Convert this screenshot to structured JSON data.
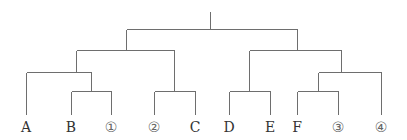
{
  "diagram": {
    "type": "tree",
    "leaves": [
      {
        "id": "A",
        "label": "A",
        "x": 26,
        "style": "letter"
      },
      {
        "id": "B",
        "label": "B",
        "x": 71,
        "style": "letter"
      },
      {
        "id": "1",
        "label": "①",
        "x": 111,
        "style": "circled"
      },
      {
        "id": "2",
        "label": "②",
        "x": 154,
        "style": "circled"
      },
      {
        "id": "C",
        "label": "C",
        "x": 195,
        "style": "letter"
      },
      {
        "id": "D",
        "label": "D",
        "x": 229,
        "style": "letter"
      },
      {
        "id": "E",
        "label": "E",
        "x": 270,
        "style": "letter"
      },
      {
        "id": "F",
        "label": "F",
        "x": 297,
        "style": "letter"
      },
      {
        "id": "3",
        "label": "③",
        "x": 338,
        "style": "circled"
      },
      {
        "id": "4",
        "label": "④",
        "x": 381,
        "style": "circled"
      }
    ],
    "structure": "((A,(B,①)),(②,C)),((D,E),((F,③),④))"
  }
}
